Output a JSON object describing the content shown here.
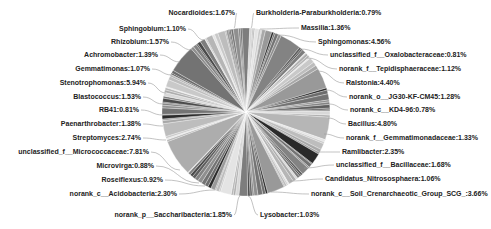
{
  "chart_data": {
    "type": "pie",
    "title": "",
    "center": [
      246,
      112
    ],
    "radius": 84,
    "labels": [
      {
        "name": "Nocardioides",
        "value": 1.67,
        "text": "Nocardioides:1.67%",
        "x": 235,
        "y": 15,
        "anchor": "end",
        "px": 234,
        "py": 28
      },
      {
        "name": "Burkholderia-Paraburkholderia",
        "value": 0.79,
        "text": "Burkholderia-Paraburkholderia:0.79%",
        "x": 256,
        "y": 15,
        "anchor": "start",
        "px": 251,
        "py": 28
      },
      {
        "name": "Massilia",
        "value": 1.36,
        "text": "Massilia:1.36%",
        "x": 301,
        "y": 30,
        "anchor": "start",
        "px": 260,
        "py": 29
      },
      {
        "name": "Sphingomonas",
        "value": 4.56,
        "text": "Sphingomonas:4.56%",
        "x": 318,
        "y": 44,
        "anchor": "start",
        "px": 278,
        "py": 35
      },
      {
        "name": "unclassified_f__Oxalobacteraceae",
        "value": 0.81,
        "text": "unclassified_f__Oxalobacteraceae:0.81%",
        "x": 330,
        "y": 57,
        "anchor": "start",
        "px": 300,
        "py": 49
      },
      {
        "name": "norank_f__Tepidisphaeraceae",
        "value": 1.12,
        "text": "norank_f__Tepidisphaeraceae:1.12%",
        "x": 339,
        "y": 71,
        "anchor": "start",
        "px": 307,
        "py": 58
      },
      {
        "name": "Ralstonia",
        "value": 4.4,
        "text": "Ralstonia:4.40%",
        "x": 346,
        "y": 85,
        "anchor": "start",
        "px": 318,
        "py": 71
      },
      {
        "name": "norank_o__JG30-KF-CM45",
        "value": 1.28,
        "text": "norank_o__JG30-KF-CM45:1.28%",
        "x": 349,
        "y": 99,
        "anchor": "start",
        "px": 326,
        "py": 90
      },
      {
        "name": "norank_c__KD4-96",
        "value": 0.78,
        "text": "norank_c__KD4-96:0.78%",
        "x": 350,
        "y": 112,
        "anchor": "start",
        "px": 329,
        "py": 104
      },
      {
        "name": "Bacillus",
        "value": 4.8,
        "text": "Bacillus:4.80%",
        "x": 348,
        "y": 126,
        "anchor": "start",
        "px": 328,
        "py": 118
      },
      {
        "name": "norank_f__Gemmatimonadaceae",
        "value": 1.33,
        "text": "norank_f__Gemmatimonadaceae:1.33%",
        "x": 346,
        "y": 140,
        "anchor": "start",
        "px": 324,
        "py": 134
      },
      {
        "name": "Ramlibacter",
        "value": 2.35,
        "text": "Ramlibacter:2.35%",
        "x": 342,
        "y": 154,
        "anchor": "start",
        "px": 316,
        "py": 152
      },
      {
        "name": "unclassified_f__Bacillaceae",
        "value": 1.68,
        "text": "unclassified_f__Bacillaceae:1.68%",
        "x": 336,
        "y": 167,
        "anchor": "start",
        "px": 304,
        "py": 168
      },
      {
        "name": "Candidatus_Nitrososphaera",
        "value": 1.06,
        "text": "Candidatus_Nitrososphaera:1.06%",
        "x": 325,
        "y": 181,
        "anchor": "start",
        "px": 290,
        "py": 181
      },
      {
        "name": "norank_c__Soil_Crenarchaeotic_Group_SCG_",
        "value": 3.66,
        "text": "norank_c__Soil_Crenarchaeotic_Group_SCG_:3.66%",
        "x": 311,
        "y": 196,
        "anchor": "start",
        "px": 271,
        "py": 192
      },
      {
        "name": "Lysobacter",
        "value": 1.03,
        "text": "Lysobacter:1.03%",
        "x": 260,
        "y": 217,
        "anchor": "start",
        "px": 248,
        "py": 196
      },
      {
        "name": "norank_p__Saccharibacteria",
        "value": 1.85,
        "text": "norank_p__Saccharibacteria:1.85%",
        "x": 232,
        "y": 217,
        "anchor": "end",
        "px": 240,
        "py": 196
      },
      {
        "name": "norank_c__Acidobacteria",
        "value": 2.3,
        "text": "norank_c__Acidobacteria:2.30%",
        "x": 177,
        "y": 196,
        "anchor": "end",
        "px": 215,
        "py": 190
      },
      {
        "name": "Roseiflexus",
        "value": 0.92,
        "text": "Roseiflexus:0.92%",
        "x": 163,
        "y": 182,
        "anchor": "end",
        "px": 205,
        "py": 186
      },
      {
        "name": "Microvirga",
        "value": 0.88,
        "text": "Microvirga:0.88%",
        "x": 154,
        "y": 168,
        "anchor": "end",
        "px": 199,
        "py": 183
      },
      {
        "name": "unclassified_f__Micrococcaceae",
        "value": 7.81,
        "text": "unclassified_f__Micrococcaceae:7.81%",
        "x": 149,
        "y": 154,
        "anchor": "end",
        "px": 180,
        "py": 170
      },
      {
        "name": "Streptomyces",
        "value": 2.74,
        "text": "Streptomyces:2.74%",
        "x": 141,
        "y": 140,
        "anchor": "end",
        "px": 166,
        "py": 140
      },
      {
        "name": "Paenarthrobacter",
        "value": 1.38,
        "text": "Paenarthrobacter:1.38%",
        "x": 141,
        "y": 126,
        "anchor": "end",
        "px": 163,
        "py": 126
      },
      {
        "name": "RB41",
        "value": 0.81,
        "text": "RB41:0.81%",
        "x": 139,
        "y": 112,
        "anchor": "end",
        "px": 163,
        "py": 115
      },
      {
        "name": "Blastococcus",
        "value": 1.53,
        "text": "Blastococcus:1.53%",
        "x": 141,
        "y": 99,
        "anchor": "end",
        "px": 163,
        "py": 104
      },
      {
        "name": "Stenotrophomonas",
        "value": 5.94,
        "text": "Stenotrophomonas:5.94%",
        "x": 146,
        "y": 85,
        "anchor": "end",
        "px": 166,
        "py": 93
      },
      {
        "name": "Gemmatimonas",
        "value": 1.07,
        "text": "Gemmatimonas:1.07%",
        "x": 150,
        "y": 71,
        "anchor": "end",
        "px": 172,
        "py": 75
      },
      {
        "name": "Achromobacter",
        "value": 1.39,
        "text": "Achromobacter:1.39%",
        "x": 158,
        "y": 57,
        "anchor": "end",
        "px": 180,
        "py": 62
      },
      {
        "name": "Rhizobium",
        "value": 1.57,
        "text": "Rhizobium:1.57%",
        "x": 169,
        "y": 44,
        "anchor": "end",
        "px": 192,
        "py": 50
      },
      {
        "name": "Sphingobium",
        "value": 1.1,
        "text": "Sphingobium:1.10%",
        "x": 186,
        "y": 31,
        "anchor": "end",
        "px": 204,
        "py": 40
      }
    ],
    "legend": "none",
    "note": "Many additional unlabeled small slices (<0.78%) make up the remainder"
  }
}
